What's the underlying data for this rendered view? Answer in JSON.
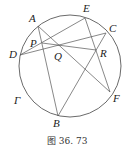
{
  "figure": {
    "caption": "图 36. 73",
    "circle": {
      "label": "Γ",
      "cx": 70,
      "cy": 66,
      "r": 51
    },
    "points": {
      "A": {
        "label": "A",
        "x": 38,
        "y": 26
      },
      "E": {
        "label": "E",
        "x": 85,
        "y": 18
      },
      "C": {
        "label": "C",
        "x": 106,
        "y": 33
      },
      "D": {
        "label": "D",
        "x": 20,
        "y": 55
      },
      "F": {
        "label": "F",
        "x": 110,
        "y": 92
      },
      "B": {
        "label": "B",
        "x": 58,
        "y": 116
      },
      "P": {
        "label": "P",
        "x": 42,
        "y": 43
      },
      "Q": {
        "label": "Q",
        "x": 60,
        "y": 46
      },
      "R": {
        "label": "R",
        "x": 96,
        "y": 50
      }
    },
    "segments": [
      [
        "A",
        "B"
      ],
      [
        "A",
        "F"
      ],
      [
        "D",
        "E"
      ],
      [
        "D",
        "C"
      ],
      [
        "P",
        "R"
      ],
      [
        "E",
        "F"
      ],
      [
        "B",
        "C"
      ]
    ]
  }
}
